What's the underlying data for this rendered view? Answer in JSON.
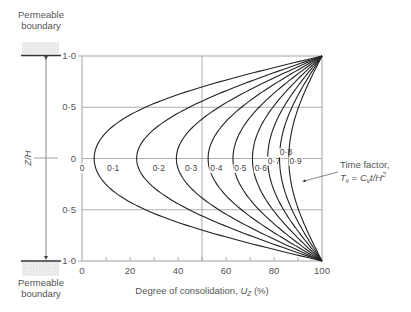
{
  "chart_data": {
    "type": "line",
    "title": "",
    "xlabel": "Degree of consolidation, U_Z (%)",
    "xlabel_main": "Degree of consolidation, ",
    "xlabel_var": "U",
    "xlabel_sub": "Z",
    "xlabel_unit": " (%)",
    "ylabel": "Z/H",
    "xlim": [
      0,
      100
    ],
    "ylim": [
      -1.0,
      1.0
    ],
    "x_ticks": [
      "0",
      "20",
      "40",
      "60",
      "80",
      "100"
    ],
    "y_ticks_top": [
      "1·0",
      "0·5",
      "0"
    ],
    "y_ticks_bottom": [
      "0·5",
      "1·0"
    ],
    "grid": {
      "horizontal": [
        0.5,
        0,
        -0.5
      ],
      "vertical": [
        50
      ]
    },
    "series_label_prefix": "Time factor",
    "series": [
      {
        "name": "0",
        "Tv": 0,
        "U_at_midplane": 0
      },
      {
        "name": "0·1",
        "Tv": 0.1,
        "U_at_midplane": 5
      },
      {
        "name": "0·2",
        "Tv": 0.2,
        "U_at_midplane": 23
      },
      {
        "name": "0·3",
        "Tv": 0.3,
        "U_at_midplane": 40
      },
      {
        "name": "0·4",
        "Tv": 0.4,
        "U_at_midplane": 53
      },
      {
        "name": "0·5",
        "Tv": 0.5,
        "U_at_midplane": 64
      },
      {
        "name": "0·6",
        "Tv": 0.6,
        "U_at_midplane": 73
      },
      {
        "name": "0·7",
        "Tv": 0.7,
        "U_at_midplane": 79
      },
      {
        "name": "0·8",
        "Tv": 0.8,
        "U_at_midplane": 84
      },
      {
        "name": "0·9",
        "Tv": 0.9,
        "U_at_midplane": 88
      }
    ],
    "annotation": {
      "line1": "Time factor,",
      "formula": "T_v = C_v t / H^2"
    }
  },
  "boundaries": {
    "top_label_1": "Permeable",
    "top_label_2": "boundary",
    "bottom_label_1": "Permeable",
    "bottom_label_2": "boundary"
  },
  "colors": {
    "curve": "#222222",
    "grid": "#9a9a9a",
    "axis": "#9a9a9a",
    "text": "#555555"
  }
}
